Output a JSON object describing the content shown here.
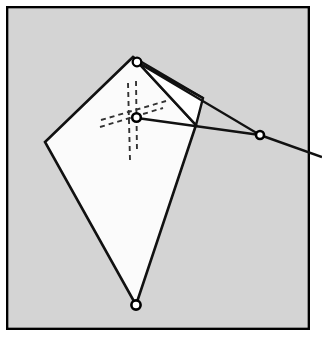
{
  "figure": {
    "title": "Kite with spars, bridle and flying line",
    "canvas": {
      "width": 322,
      "height": 342
    },
    "colors": {
      "page_background": "#ffffff",
      "frame_stroke": "#000000",
      "panel_background": "#d4d4d4",
      "sail_fill": "#fbfbfb",
      "flap_fill": "#ffffff",
      "line_stroke": "#111111",
      "dashed_stroke": "#333333",
      "marker_fill": "#ffffff",
      "marker_stroke": "#000000"
    },
    "frame": {
      "label": "picture-frame",
      "x": 6,
      "y": 6,
      "width": 304,
      "height": 324,
      "stroke_width": 2.4
    },
    "panel": {
      "label": "gray-panel",
      "x": 8.5,
      "y": 8.5,
      "width": 299,
      "height": 319
    },
    "sail": {
      "label": "kite-sail",
      "points": "133,57 45,142 136,305 196,125",
      "stroke_width": 2.6
    },
    "flap": {
      "label": "kite-flap",
      "points": "133,57 203,98 196,125",
      "stroke_width": 2.4
    },
    "spine_edge": {
      "label": "flap-hinge-edge",
      "x1": 137,
      "y1": 62,
      "x2": 203,
      "y2": 98,
      "stroke_width": 2.2
    },
    "bridle_lines": [
      {
        "label": "bridle-upper",
        "x1": 137,
        "y1": 62,
        "x2": 260,
        "y2": 135,
        "stroke_width": 2.2
      },
      {
        "label": "bridle-lower",
        "x1": 137,
        "y1": 118,
        "x2": 260,
        "y2": 135,
        "stroke_width": 2.4
      }
    ],
    "flying_line": {
      "label": "flying-line",
      "x1": 260,
      "y1": 135,
      "x2": 322,
      "y2": 157,
      "stroke_width": 2.4
    },
    "dashed_axes": [
      {
        "label": "vertical-spar-left",
        "x1": 128,
        "y1": 83,
        "x2": 130,
        "y2": 160
      },
      {
        "label": "vertical-spar-right",
        "x1": 136,
        "y1": 81,
        "x2": 137,
        "y2": 152
      },
      {
        "label": "cross-spar-upper",
        "x1": 101,
        "y1": 120,
        "x2": 166,
        "y2": 101
      },
      {
        "label": "cross-spar-lower",
        "x1": 100,
        "y1": 127,
        "x2": 163,
        "y2": 108
      }
    ],
    "dash_pattern": "5,4",
    "dashed_stroke_width": 1.9,
    "markers": [
      {
        "label": "apex-fitting",
        "cx": 137,
        "cy": 62,
        "r": 4.3,
        "ring": 2.3
      },
      {
        "label": "bridle-hub",
        "cx": 136.5,
        "cy": 117.5,
        "r": 4.3,
        "ring": 2.6
      },
      {
        "label": "tail-fitting",
        "cx": 136,
        "cy": 305,
        "r": 4.6,
        "ring": 2.6
      },
      {
        "label": "tow-point-ring",
        "cx": 260,
        "cy": 135,
        "r": 4.0,
        "ring": 2.6
      }
    ]
  }
}
